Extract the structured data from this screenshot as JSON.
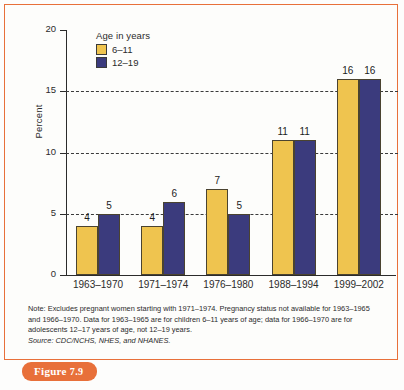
{
  "figure": {
    "badge_prefix": "Figure",
    "badge_number": "7.9"
  },
  "colors": {
    "series_6_11": "#efc44f",
    "series_12_19": "#3b3b7d",
    "frame": "#e8703a",
    "badge": "#e8703a",
    "axis": "#2b2b2b",
    "background": "#fdfdfb"
  },
  "notes": {
    "note_line": "Note: Excludes pregnant women starting with 1971–1974. Pregnancy status not available for 1963–1965 and 1966–1970. Data for 1963–1965 are for children 6–11 years of age; data for 1966–1970 are for adolescents 12–17 years of age, not 12–19 years.",
    "source_line": "Source: CDC/NCHS, NHES, and NHANES."
  },
  "chart_data": {
    "type": "bar",
    "title": "",
    "xlabel": "",
    "ylabel": "Percent",
    "ylim": [
      0,
      20
    ],
    "yticks": [
      0,
      5,
      10,
      15,
      20
    ],
    "ytick_labels": [
      "0",
      "5",
      "10",
      "15",
      "20"
    ],
    "grid": true,
    "gridlines_at": [
      5,
      10,
      15
    ],
    "legend_title": "Age in years",
    "legend_position": "top-left-inside",
    "categories": [
      "1963–1970",
      "1971–1974",
      "1976–1980",
      "1988–1994",
      "1999–2002"
    ],
    "series": [
      {
        "name": "6–11",
        "color": "#efc44f",
        "values": [
          4,
          4,
          7,
          11,
          16
        ],
        "value_labels": [
          "4",
          "4",
          "7",
          "11",
          "16"
        ]
      },
      {
        "name": "12–19",
        "color": "#3b3b7d",
        "values": [
          5,
          6,
          5,
          11,
          16
        ],
        "value_labels": [
          "5",
          "6",
          "5",
          "11",
          "16"
        ]
      }
    ]
  }
}
